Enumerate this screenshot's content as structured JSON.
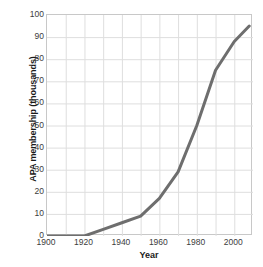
{
  "chart_data": {
    "type": "line",
    "title": "",
    "xlabel": "Year",
    "ylabel": "APA membership (thousands)",
    "xlim": [
      1900,
      2010
    ],
    "ylim": [
      0,
      100
    ],
    "xticks": [
      1900,
      1920,
      1940,
      1960,
      1980,
      2000
    ],
    "yticks": [
      0,
      10,
      20,
      30,
      40,
      50,
      60,
      70,
      80,
      90,
      100
    ],
    "xtick_labels": [
      "1900",
      "1920",
      "1940",
      "1960",
      "1980",
      "2000"
    ],
    "ytick_labels": [
      "0",
      "10",
      "20",
      "30",
      "40",
      "50",
      "60",
      "70",
      "80",
      "90",
      "100"
    ],
    "grid": true,
    "grid_x_step": 10,
    "grid_y_step": 10,
    "legend": false,
    "series": [
      {
        "name": "APA membership",
        "color": "#6e6e6e",
        "line_width": 3,
        "x": [
          1900,
          1910,
          1920,
          1930,
          1940,
          1950,
          1960,
          1970,
          1980,
          1990,
          2000,
          2008
        ],
        "values": [
          0,
          0,
          0,
          3,
          6,
          9,
          17,
          29,
          50,
          75,
          88,
          95
        ]
      }
    ]
  },
  "axes": {
    "x_title": "Year",
    "y_title": "APA membership (thousands)"
  },
  "frame": {
    "border_color": "#c8c8c8",
    "grid_color": "#dedede",
    "background": "#ffffff"
  }
}
